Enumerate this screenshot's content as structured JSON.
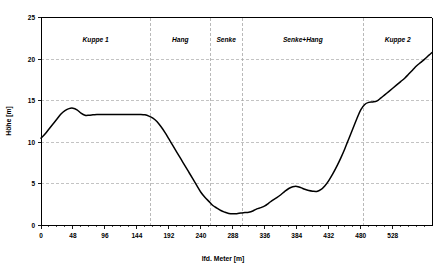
{
  "chart_data": {
    "type": "line",
    "title": "",
    "subtitle": "",
    "xlabel": "lfd. Meter [m]",
    "ylabel": "Höhe [m]",
    "xlim": [
      0,
      587
    ],
    "ylim": [
      0,
      25
    ],
    "grid": true,
    "legend": null,
    "xticks": [
      0,
      48,
      96,
      144,
      192,
      240,
      288,
      336,
      384,
      432,
      480,
      528
    ],
    "xtick_labels": [
      "0",
      "48",
      "96",
      "144",
      "192",
      "240",
      "288",
      "336",
      "384",
      "432",
      "480",
      "528"
    ],
    "yticks": [
      0,
      5,
      10,
      15,
      20,
      25
    ],
    "ytick_labels": [
      "0",
      "5",
      "10",
      "15",
      "20",
      "25"
    ],
    "series": [
      {
        "name": "Geländehöhe",
        "color": "#000000",
        "x": [
          0,
          6,
          12,
          18,
          24,
          30,
          36,
          42,
          48,
          54,
          60,
          66,
          72,
          78,
          84,
          90,
          96,
          108,
          120,
          132,
          144,
          150,
          156,
          162,
          168,
          174,
          180,
          186,
          192,
          198,
          204,
          210,
          216,
          222,
          228,
          234,
          240,
          246,
          252,
          258,
          264,
          270,
          276,
          282,
          288,
          294,
          300,
          306,
          312,
          318,
          324,
          330,
          336,
          342,
          348,
          354,
          360,
          366,
          372,
          378,
          384,
          390,
          396,
          402,
          408,
          414,
          420,
          426,
          432,
          438,
          444,
          450,
          456,
          462,
          468,
          474,
          480,
          486,
          492,
          498,
          504,
          510,
          516,
          522,
          528,
          534,
          540,
          546,
          552,
          558,
          564,
          570,
          576,
          582,
          587
        ],
        "y": [
          10.5,
          11.0,
          11.6,
          12.2,
          12.8,
          13.4,
          13.8,
          14.05,
          14.1,
          13.9,
          13.5,
          13.25,
          13.25,
          13.3,
          13.35,
          13.35,
          13.35,
          13.35,
          13.35,
          13.35,
          13.35,
          13.35,
          13.3,
          13.15,
          12.9,
          12.5,
          11.9,
          11.2,
          10.4,
          9.6,
          8.8,
          8.0,
          7.2,
          6.4,
          5.6,
          4.8,
          4.0,
          3.4,
          2.9,
          2.4,
          2.1,
          1.8,
          1.6,
          1.45,
          1.4,
          1.42,
          1.5,
          1.55,
          1.6,
          1.75,
          2.0,
          2.15,
          2.35,
          2.7,
          3.05,
          3.35,
          3.7,
          4.1,
          4.45,
          4.65,
          4.7,
          4.55,
          4.35,
          4.2,
          4.12,
          4.1,
          4.3,
          4.75,
          5.4,
          6.2,
          7.1,
          8.1,
          9.2,
          10.4,
          11.6,
          12.8,
          13.9,
          14.55,
          14.8,
          14.85,
          14.95,
          15.3,
          15.7,
          16.1,
          16.5,
          16.9,
          17.3,
          17.7,
          18.2,
          18.7,
          19.2,
          19.6,
          20.0,
          20.45,
          20.8
        ]
      }
    ],
    "regions": [
      {
        "label": "Kuppe 1",
        "start": 0,
        "end": 164
      },
      {
        "label": "Hang",
        "start": 164,
        "end": 254
      },
      {
        "label": "Senke",
        "start": 254,
        "end": 302
      },
      {
        "label": "Senke+Hang",
        "start": 302,
        "end": 484
      },
      {
        "label": "Kuppe 2",
        "start": 484,
        "end": 587
      }
    ],
    "region_dividers": [
      164,
      254,
      302,
      484
    ]
  },
  "colors": {
    "curve": "#000000",
    "grid": "#b4b4b4",
    "axis": "#000000",
    "background": "#ffffff"
  }
}
